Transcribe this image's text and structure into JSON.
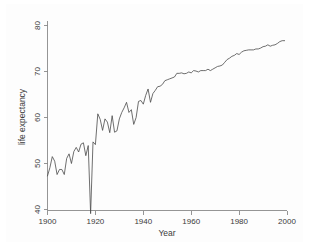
{
  "chart_data": {
    "type": "line",
    "title": "",
    "xlabel": "Year",
    "ylabel": "life expectancy",
    "xlim": [
      1900,
      2000
    ],
    "ylim": [
      38,
      81
    ],
    "xticks": [
      1900,
      1920,
      1940,
      1960,
      1980,
      2000
    ],
    "yticks": [
      40,
      50,
      60,
      70,
      80
    ],
    "xtick_labels": [
      "1900",
      "1920",
      "1940",
      "1960",
      "1980",
      "2000"
    ],
    "ytick_labels": [
      "40",
      "50",
      "60",
      "70",
      "80"
    ],
    "grid": false,
    "legend": null,
    "legend_position": "none",
    "line_color": "#4a4a4a",
    "background_color": "#ffffff",
    "axis_color": "#8a8a8a",
    "series": [
      {
        "name": "life expectancy",
        "x": [
          1900,
          1901,
          1902,
          1903,
          1904,
          1905,
          1906,
          1907,
          1908,
          1909,
          1910,
          1911,
          1912,
          1913,
          1914,
          1915,
          1916,
          1917,
          1918,
          1919,
          1920,
          1921,
          1922,
          1923,
          1924,
          1925,
          1926,
          1927,
          1928,
          1929,
          1930,
          1931,
          1932,
          1933,
          1934,
          1935,
          1936,
          1937,
          1938,
          1939,
          1940,
          1941,
          1942,
          1943,
          1944,
          1945,
          1946,
          1947,
          1948,
          1949,
          1950,
          1951,
          1952,
          1953,
          1954,
          1955,
          1956,
          1957,
          1958,
          1959,
          1960,
          1961,
          1962,
          1963,
          1964,
          1965,
          1966,
          1967,
          1968,
          1969,
          1970,
          1971,
          1972,
          1973,
          1974,
          1975,
          1976,
          1977,
          1978,
          1979,
          1980,
          1981,
          1982,
          1983,
          1984,
          1985,
          1986,
          1987,
          1988,
          1989,
          1990,
          1991,
          1992,
          1993,
          1994,
          1995,
          1996,
          1997,
          1998,
          1999
        ],
        "values": [
          47.3,
          49.1,
          51.5,
          50.5,
          47.6,
          48.7,
          48.7,
          47.6,
          51.1,
          52.1,
          50.0,
          52.6,
          53.5,
          52.5,
          54.2,
          54.5,
          51.7,
          53.9,
          39.1,
          54.7,
          54.1,
          60.8,
          59.6,
          57.2,
          59.7,
          59.0,
          56.7,
          60.4,
          56.8,
          57.1,
          59.7,
          61.1,
          62.1,
          63.3,
          61.1,
          61.7,
          58.5,
          60.0,
          63.5,
          63.7,
          62.9,
          64.8,
          66.2,
          63.3,
          65.2,
          65.9,
          66.7,
          66.8,
          67.2,
          68.0,
          68.2,
          68.4,
          68.6,
          68.8,
          69.6,
          69.6,
          69.7,
          69.5,
          69.6,
          69.9,
          69.7,
          70.2,
          70.1,
          69.9,
          70.2,
          70.2,
          70.2,
          70.5,
          70.2,
          70.5,
          70.8,
          71.1,
          71.2,
          71.4,
          72.0,
          72.6,
          72.9,
          73.3,
          73.5,
          73.9,
          73.7,
          74.2,
          74.5,
          74.6,
          74.7,
          74.7,
          74.7,
          74.9,
          74.9,
          75.1,
          75.4,
          75.5,
          75.8,
          75.5,
          75.7,
          75.8,
          76.1,
          76.5,
          76.7,
          76.7
        ]
      }
    ]
  },
  "axis": {
    "y_title": "life expectancy",
    "x_title": "Year"
  }
}
